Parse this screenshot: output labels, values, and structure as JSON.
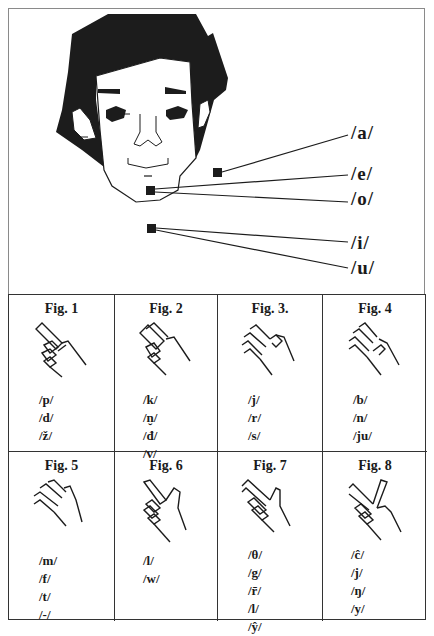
{
  "face_diagram": {
    "vowels": [
      {
        "label": "/a/",
        "marker": "cheek"
      },
      {
        "label": "/e/",
        "marker": "chin"
      },
      {
        "label": "/o/",
        "marker": "chin"
      },
      {
        "label": "/i/",
        "marker": "throat"
      },
      {
        "label": "/u/",
        "marker": "throat"
      }
    ]
  },
  "figures": [
    {
      "title": "Fig. 1",
      "hand_icon": "hand-index-point-icon",
      "phonemes": [
        "/p/",
        "/d/",
        "/ž/"
      ]
    },
    {
      "title": "Fig. 2",
      "hand_icon": "hand-two-finger-point-icon",
      "phonemes": [
        "/k/",
        "/n̮/",
        "/đ/",
        "/v/"
      ]
    },
    {
      "title": "Fig. 3.",
      "hand_icon": "hand-thumb-touch-icon",
      "phonemes": [
        "/j/",
        "/r/",
        "/s/"
      ]
    },
    {
      "title": "Fig. 4",
      "hand_icon": "hand-flat-thumb-out-icon",
      "phonemes": [
        "/b/",
        "/n/",
        "/ju/"
      ]
    },
    {
      "title": "Fig. 5",
      "hand_icon": "hand-open-flat-icon",
      "phonemes": [
        "/m/",
        "/f/",
        "/t/",
        "/-/"
      ]
    },
    {
      "title": "Fig. 6",
      "hand_icon": "hand-index-up-icon",
      "phonemes": [
        "/l/",
        "/w/"
      ]
    },
    {
      "title": "Fig. 7",
      "hand_icon": "hand-two-finger-thumb-up-icon",
      "phonemes": [
        "/θ/",
        "/g/",
        "/r̄/",
        "/l/",
        "/ŷ/"
      ]
    },
    {
      "title": "Fig. 8",
      "hand_icon": "hand-v-sign-icon",
      "phonemes": [
        "/ĉ/",
        "/j/",
        "/ŋ/",
        "/y/"
      ]
    }
  ]
}
